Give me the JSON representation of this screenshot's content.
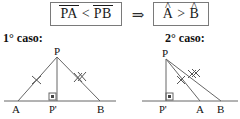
{
  "implication": {
    "hypothesis": {
      "left_segment": "PA",
      "operator": "<",
      "right_segment": "PB",
      "overline": true
    },
    "arrow": "⇒",
    "thesis": {
      "left_angle": "A",
      "left_hat": "^",
      "operator": ">",
      "right_angle": "B",
      "right_hat": "^"
    }
  },
  "cases": [
    {
      "caption": "1° caso:",
      "points": {
        "apex": "P",
        "foot": "P'",
        "left": "A",
        "right": "B"
      },
      "marks": {
        "pa_ticks": 1,
        "pb_ticks": 2,
        "right_angle_at": "P'"
      }
    },
    {
      "caption": "2° caso:",
      "points": {
        "apex": "P",
        "foot": "P'",
        "left": "A",
        "right": "B"
      },
      "marks": {
        "pa_ticks": 1,
        "pb_ticks": 2,
        "right_angle_at": "P'"
      }
    }
  ],
  "colors": {
    "line": "#555555",
    "text": "#111111",
    "box_border": "#7a7a7a",
    "background": "#ffffff"
  }
}
